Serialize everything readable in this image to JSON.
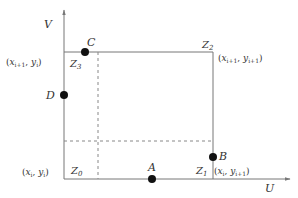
{
  "diagram": {
    "axes": {
      "u_label": "U",
      "v_label": "V"
    },
    "corners": {
      "z0": {
        "name": "Z",
        "sub": "0",
        "coord": {
          "x": "x",
          "xs": "i",
          "y": "y",
          "ys": "i"
        }
      },
      "z1": {
        "name": "Z",
        "sub": "1",
        "coord": {
          "x": "x",
          "xs": "i",
          "y": "y",
          "ys": "i+1"
        }
      },
      "z2": {
        "name": "Z",
        "sub": "2",
        "coord": {
          "x": "x",
          "xs": "i+1",
          "y": "y",
          "ys": "i+1"
        }
      },
      "z3": {
        "name": "Z",
        "sub": "3",
        "coord": {
          "x": "x",
          "xs": "i+1",
          "y": "y",
          "ys": "i"
        }
      }
    },
    "points": {
      "A": "A",
      "B": "B",
      "C": "C",
      "D": "D"
    },
    "colors": {
      "line": "#777777",
      "dot": "#111111",
      "text": "#333333"
    }
  }
}
